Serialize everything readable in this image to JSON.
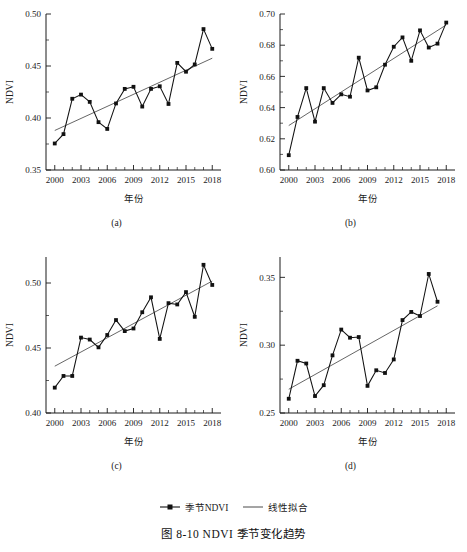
{
  "figure": {
    "caption": "图 8-10  NDVI 季节变化趋势",
    "legend": [
      {
        "name": "seasonal-ndvi",
        "label": "季节NDVI",
        "style": "line-with-square-marker",
        "color": "#111111"
      },
      {
        "name": "linear-fit",
        "label": "线性拟合",
        "style": "plain-line",
        "color": "#4a4a4a"
      }
    ]
  },
  "panels": {
    "a": {
      "label": "(a)"
    },
    "b": {
      "label": "(b)"
    },
    "c": {
      "label": "(c)"
    },
    "d": {
      "label": "(d)"
    }
  },
  "chart_data": [
    {
      "id": "a",
      "type": "line",
      "title": "",
      "panel_label": "(a)",
      "xlabel": "年份",
      "ylabel": "NDVI",
      "xlim": [
        1999,
        2019
      ],
      "ylim": [
        0.35,
        0.5
      ],
      "xticks": [
        2000,
        2003,
        2006,
        2009,
        2012,
        2015,
        2018
      ],
      "yticks": [
        0.35,
        0.4,
        0.45,
        0.5
      ],
      "yticks_minor": [
        0.375,
        0.425,
        0.475
      ],
      "grid": false,
      "legend_position": "below-figure",
      "x": [
        2000,
        2001,
        2002,
        2003,
        2004,
        2005,
        2006,
        2007,
        2008,
        2009,
        2010,
        2011,
        2012,
        2013,
        2014,
        2015,
        2016,
        2017,
        2018
      ],
      "series": [
        {
          "name": "季节NDVI",
          "marker": "square",
          "values": [
            0.3755,
            0.3845,
            0.4185,
            0.4225,
            0.4155,
            0.396,
            0.3895,
            0.414,
            0.428,
            0.43,
            0.411,
            0.428,
            0.4305,
            0.4135,
            0.453,
            0.4445,
            0.4515,
            0.4855,
            0.4665
          ]
        },
        {
          "name": "线性拟合",
          "type": "trend",
          "endpoints": [
            [
              2000,
              0.388
            ],
            [
              2018,
              0.4575
            ]
          ]
        }
      ]
    },
    {
      "id": "b",
      "type": "line",
      "title": "",
      "panel_label": "(b)",
      "xlabel": "年份",
      "ylabel": "NDVI",
      "xlim": [
        1999,
        2019
      ],
      "ylim": [
        0.6,
        0.7
      ],
      "xticks": [
        2000,
        2003,
        2006,
        2009,
        2012,
        2015,
        2018
      ],
      "yticks": [
        0.6,
        0.62,
        0.64,
        0.66,
        0.68,
        0.7
      ],
      "yticks_minor": [
        0.61,
        0.63,
        0.65,
        0.67,
        0.69
      ],
      "grid": false,
      "legend_position": "below-figure",
      "x": [
        2000,
        2001,
        2002,
        2003,
        2004,
        2005,
        2006,
        2007,
        2008,
        2009,
        2010,
        2011,
        2012,
        2013,
        2014,
        2015,
        2016,
        2017,
        2018
      ],
      "series": [
        {
          "name": "季节NDVI",
          "marker": "square",
          "values": [
            0.6095,
            0.634,
            0.6525,
            0.631,
            0.6525,
            0.643,
            0.6485,
            0.647,
            0.672,
            0.651,
            0.653,
            0.6675,
            0.679,
            0.685,
            0.67,
            0.6895,
            0.6785,
            0.681,
            0.6945
          ]
        },
        {
          "name": "线性拟合",
          "type": "trend",
          "endpoints": [
            [
              2000,
              0.6285
            ],
            [
              2018,
              0.693
            ]
          ]
        }
      ]
    },
    {
      "id": "c",
      "type": "line",
      "title": "",
      "panel_label": "(c)",
      "xlabel": "年份",
      "ylabel": "NDVI",
      "xlim": [
        1999,
        2019
      ],
      "ylim": [
        0.4,
        0.52
      ],
      "xticks": [
        2000,
        2003,
        2006,
        2009,
        2012,
        2015,
        2018
      ],
      "yticks": [
        0.4,
        0.45,
        0.5
      ],
      "yticks_minor": [
        0.425,
        0.475
      ],
      "grid": false,
      "legend_position": "below-figure",
      "x": [
        2000,
        2001,
        2002,
        2003,
        2004,
        2005,
        2006,
        2007,
        2008,
        2009,
        2010,
        2011,
        2012,
        2013,
        2014,
        2015,
        2016,
        2017,
        2018
      ],
      "series": [
        {
          "name": "季节NDVI",
          "marker": "square",
          "values": [
            0.4195,
            0.4285,
            0.4285,
            0.458,
            0.4565,
            0.4505,
            0.46,
            0.4715,
            0.463,
            0.465,
            0.4775,
            0.489,
            0.457,
            0.4845,
            0.4835,
            0.493,
            0.474,
            0.514,
            0.4985
          ]
        },
        {
          "name": "线性拟合",
          "type": "trend",
          "endpoints": [
            [
              2000,
              0.436
            ],
            [
              2018,
              0.5015
            ]
          ]
        }
      ]
    },
    {
      "id": "d",
      "type": "line",
      "title": "",
      "panel_label": "(d)",
      "xlabel": "年份",
      "ylabel": "NDVI",
      "xlim": [
        1999,
        2019
      ],
      "ylim": [
        0.25,
        0.365
      ],
      "xticks": [
        2000,
        2003,
        2006,
        2009,
        2012,
        2015,
        2018
      ],
      "yticks": [
        0.25,
        0.3,
        0.35
      ],
      "yticks_minor": [
        0.275,
        0.325
      ],
      "grid": false,
      "legend_position": "below-figure",
      "x": [
        2000,
        2001,
        2002,
        2003,
        2004,
        2005,
        2006,
        2007,
        2008,
        2009,
        2010,
        2011,
        2012,
        2013,
        2014,
        2015,
        2016,
        2017
      ],
      "series": [
        {
          "name": "季节NDVI",
          "marker": "square",
          "values": [
            0.2605,
            0.2885,
            0.2865,
            0.2625,
            0.2705,
            0.2925,
            0.3115,
            0.3055,
            0.306,
            0.27,
            0.2815,
            0.2795,
            0.2895,
            0.3185,
            0.3245,
            0.3215,
            0.3525,
            0.332
          ]
        },
        {
          "name": "线性拟合",
          "type": "trend",
          "endpoints": [
            [
              2000,
              0.2675
            ],
            [
              2017,
              0.329
            ]
          ]
        }
      ]
    }
  ]
}
